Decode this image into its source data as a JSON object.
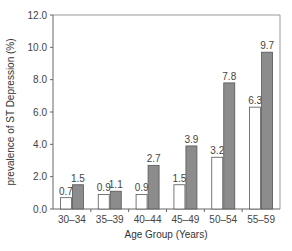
{
  "chart_data": {
    "type": "bar",
    "title": "",
    "xlabel": "Age Group (Years)",
    "ylabel": "prevalence of ST Depression (%)",
    "ylim": [
      0,
      12
    ],
    "yticks": [
      "0.0",
      "2.0",
      "4.0",
      "6.0",
      "8.0",
      "10.0",
      "12.0"
    ],
    "grid": false,
    "legend": "none",
    "categories": [
      "30–34",
      "35–39",
      "40–44",
      "45–49",
      "50–54",
      "55–59"
    ],
    "series": [
      {
        "name": "series-1 (white)",
        "color": "#ffffff",
        "values": [
          0.7,
          0.9,
          0.9,
          1.5,
          3.2,
          6.3
        ]
      },
      {
        "name": "series-2 (gray)",
        "color": "#8c8c8c",
        "values": [
          1.5,
          1.1,
          2.7,
          3.9,
          7.8,
          9.7
        ]
      }
    ]
  }
}
